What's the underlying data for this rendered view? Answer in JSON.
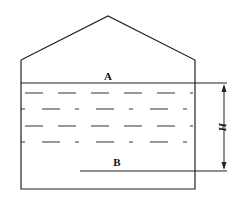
{
  "diagram": {
    "labels": {
      "surface": "A",
      "bottom": "B",
      "height": "H"
    },
    "colors": {
      "stroke": "#222222",
      "background": "#ffffff"
    }
  }
}
